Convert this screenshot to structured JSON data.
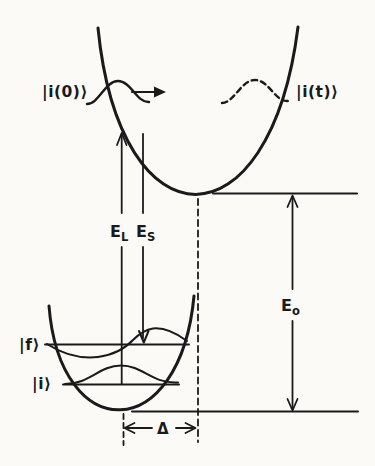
{
  "figure": {
    "paper_color": "#fbfaf7",
    "ink_color": "#1a1a1a",
    "labels": {
      "initial_wavepacket": "|i(0)⟩",
      "evolved_wavepacket": "|i(t)⟩",
      "laser_energy_main": "E",
      "laser_energy_sub": "L",
      "scattered_energy_main": "E",
      "scattered_energy_sub": "S",
      "zero_zero_energy_main": "E",
      "zero_zero_energy_sub": "o",
      "final_state": "|f⟩",
      "initial_state": "|i⟩",
      "displacement": "Δ"
    }
  }
}
